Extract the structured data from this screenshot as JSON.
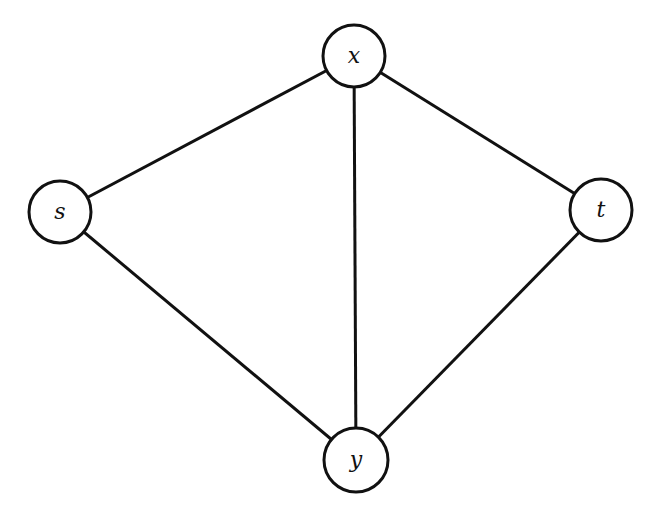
{
  "diagram": {
    "type": "undirected-graph",
    "nodes": [
      {
        "id": "x",
        "label": "x",
        "cx": 354,
        "cy": 56
      },
      {
        "id": "s",
        "label": "s",
        "cx": 60,
        "cy": 212
      },
      {
        "id": "t",
        "label": "t",
        "cx": 601,
        "cy": 210
      },
      {
        "id": "y",
        "label": "y",
        "cx": 356,
        "cy": 460
      }
    ],
    "edges": [
      {
        "from": "s",
        "to": "x"
      },
      {
        "from": "x",
        "to": "t"
      },
      {
        "from": "x",
        "to": "y"
      },
      {
        "from": "s",
        "to": "y"
      },
      {
        "from": "y",
        "to": "t"
      }
    ],
    "node_radius": 31
  }
}
